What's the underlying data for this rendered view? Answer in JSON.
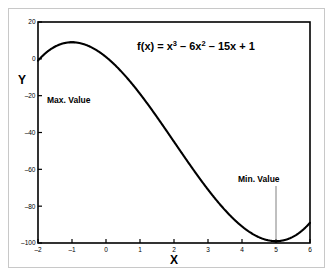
{
  "figure": {
    "equation": {
      "prefix": "f(x) = x",
      "sup1": "3",
      "mid1": " – 6x",
      "sup2": "2",
      "mid2": " – 15x + 1"
    },
    "x_axis_title": "X",
    "y_axis_title": "Y",
    "annotations": [
      {
        "label": "Max. Value",
        "x": -1,
        "y": 9
      },
      {
        "label": "Min. Value",
        "x": 5,
        "y": -99
      }
    ],
    "colors": {
      "curve": "#000000",
      "axis": "#000000",
      "leader_line": "#808080",
      "outer_border": "#c8c8c8",
      "background": "#ffffff"
    }
  },
  "chart_data": {
    "type": "line",
    "title": "",
    "subtitle": "",
    "xlabel": "X",
    "ylabel": "Y",
    "xlim": [
      -2,
      6
    ],
    "ylim": [
      -100,
      20
    ],
    "xticks": [
      -2,
      -1,
      0,
      1,
      2,
      3,
      4,
      5,
      6
    ],
    "xticklabels": [
      "–2",
      "–1",
      "0",
      "1",
      "2",
      "3",
      "4",
      "5",
      "6"
    ],
    "yticks": [
      20,
      0,
      -20,
      -40,
      -60,
      -80,
      -100
    ],
    "yticklabels": [
      "20",
      "0",
      "–20",
      "–40",
      "–60",
      "–80",
      "–100"
    ],
    "grid": false,
    "legend": null,
    "expression": "f(x) = x^3 - 6x^2 - 15x + 1",
    "annotations": [
      {
        "text": "Max. Value",
        "point_x": -1,
        "point_y": 9
      },
      {
        "text": "Min. Value",
        "point_x": 5,
        "point_y": -99
      }
    ],
    "series": [
      {
        "name": "f(x) = x^3 - 6x^2 - 15x + 1",
        "x": [
          -2,
          -1.75,
          -1.5,
          -1.25,
          -1,
          -0.75,
          -0.5,
          -0.25,
          0,
          0.25,
          0.5,
          0.75,
          1,
          1.25,
          1.5,
          1.75,
          2,
          2.25,
          2.5,
          2.75,
          3,
          3.25,
          3.5,
          3.75,
          4,
          4.25,
          4.5,
          4.75,
          5,
          5.25,
          5.5,
          5.75,
          6
        ],
        "y": [
          -1,
          3.02,
          6.13,
          8.36,
          9,
          8.8,
          7.88,
          6.3,
          1,
          -3.11,
          -7.88,
          -13.2,
          -19,
          -25.17,
          -34.63,
          -41.8,
          -49,
          -56.2,
          -63.13,
          -69.55,
          -71,
          -79.11,
          -82.13,
          -83.8,
          -84,
          -82.55,
          -79.38,
          -74.3,
          -99,
          -97.67,
          -89.38,
          -82.55,
          -89
        ],
        "notable_points": [
          {
            "label": "local maximum",
            "x": -1,
            "y": 9
          },
          {
            "label": "local minimum",
            "x": 5,
            "y": -99
          }
        ]
      }
    ]
  }
}
